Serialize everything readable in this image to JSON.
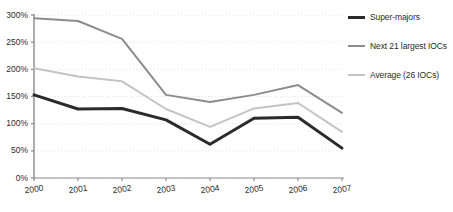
{
  "chart_data": {
    "type": "line",
    "title": "",
    "subtitle": "",
    "xlabel": "",
    "ylabel": "",
    "x": [
      "2000",
      "2001",
      "2002",
      "2003",
      "2004",
      "2005",
      "2006",
      "2007"
    ],
    "categories": [
      "2000",
      "2001",
      "2002",
      "2003",
      "2004",
      "2005",
      "2006",
      "2007"
    ],
    "ylim": [
      0,
      300
    ],
    "yticks": [
      0,
      50,
      100,
      150,
      200,
      250,
      300
    ],
    "ytick_labels": [
      "0%",
      "50%",
      "100%",
      "150%",
      "200%",
      "250%",
      "300%"
    ],
    "xtick_labels": [
      "2000",
      "2001",
      "2002",
      "2003",
      "2004",
      "2005",
      "2006",
      "2007"
    ],
    "grid": true,
    "grid_axis": "y",
    "legend_position": "right",
    "value_suffix": "%",
    "series": [
      {
        "name": "Super-majors",
        "color": "#2b2b2b",
        "width": 3,
        "values": [
          153,
          127,
          128,
          107,
          62,
          110,
          112,
          55
        ]
      },
      {
        "name": "Next 21 largest IOCs",
        "color": "#8c8c8c",
        "width": 2,
        "values": [
          294,
          289,
          256,
          153,
          140,
          153,
          171,
          120
        ]
      },
      {
        "name": "Average (26 IOCs)",
        "color": "#c4c4c4",
        "width": 2,
        "values": [
          202,
          187,
          178,
          127,
          94,
          128,
          138,
          85
        ]
      }
    ]
  },
  "axes": {
    "axis_color": "#8a8a8a",
    "grid_color": "#e3e3e3",
    "text_color": "#2b2b2b"
  },
  "legend": {
    "items": [
      {
        "label": "Super-majors"
      },
      {
        "label": "Next 21 largest IOCs"
      },
      {
        "label": "Average (26 IOCs)"
      }
    ]
  }
}
